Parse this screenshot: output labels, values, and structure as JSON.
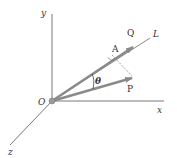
{
  "diagram": {
    "type": "vector-projection",
    "colors": {
      "axis": "#555555",
      "vector": "#8a8a8a",
      "dashed": "#777777",
      "origin_dot": "#9a9a9a",
      "text": "#333333"
    },
    "labels": {
      "y_axis": "y",
      "x_axis": "x",
      "z_axis": "z",
      "origin": "O",
      "line": "L",
      "vector_q": "Q",
      "vector_p": "P",
      "point_a": "A",
      "angle": "θ"
    }
  }
}
